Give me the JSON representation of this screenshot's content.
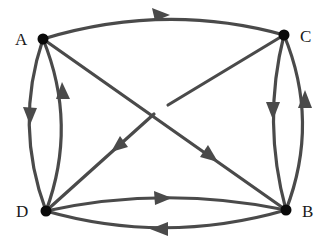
{
  "diagram": {
    "type": "directed-graph",
    "nodes": [
      {
        "id": "A",
        "label": "A",
        "x": 43,
        "y": 39
      },
      {
        "id": "C",
        "label": "C",
        "x": 284,
        "y": 35
      },
      {
        "id": "D",
        "label": "D",
        "x": 46,
        "y": 211
      },
      {
        "id": "B",
        "label": "B",
        "x": 286,
        "y": 210
      }
    ],
    "edges": [
      {
        "from": "A",
        "to": "C"
      },
      {
        "from": "A",
        "to": "D"
      },
      {
        "from": "D",
        "to": "A"
      },
      {
        "from": "A",
        "to": "B"
      },
      {
        "from": "C",
        "to": "D"
      },
      {
        "from": "C",
        "to": "B"
      },
      {
        "from": "B",
        "to": "C"
      },
      {
        "from": "D",
        "to": "B"
      },
      {
        "from": "B",
        "to": "D"
      }
    ],
    "colors": {
      "edge": "#4a4a4a",
      "node": "#0a0a0a",
      "background": "#ffffff"
    }
  }
}
